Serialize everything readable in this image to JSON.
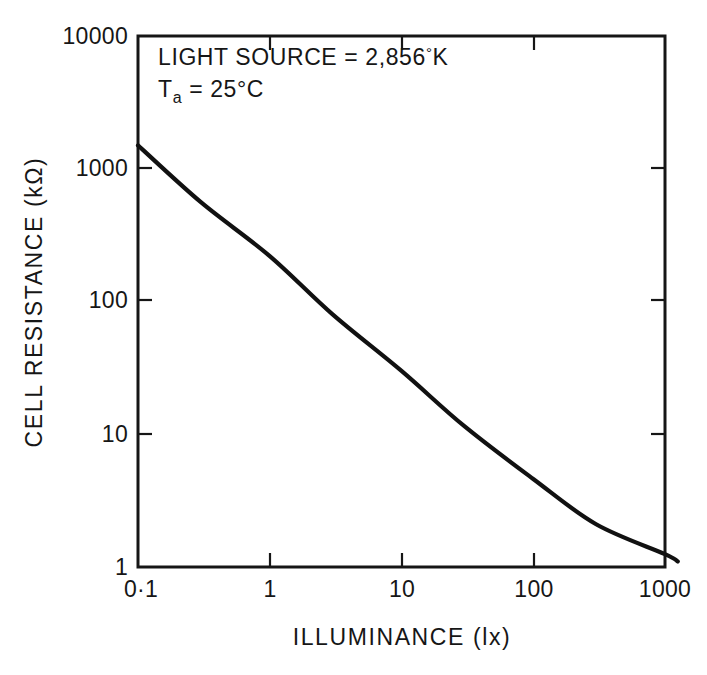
{
  "chart_data": {
    "type": "line",
    "title": "",
    "xlabel": "ILLUMINANCE (lx)",
    "ylabel": "CELL RESISTANCE (kΩ)",
    "xscale": "log",
    "yscale": "log",
    "xlim": [
      0.1,
      1000
    ],
    "ylim": [
      1,
      10000
    ],
    "grid": false,
    "legend": null,
    "xticks": [
      0.1,
      1,
      10,
      100,
      1000
    ],
    "xtick_labels": [
      "0·1",
      "1",
      "10",
      "100",
      "1000"
    ],
    "yticks": [
      1,
      10,
      100,
      1000,
      10000
    ],
    "ytick_labels": [
      "1",
      "10",
      "100",
      "1000",
      "10000"
    ],
    "series": [
      {
        "name": "cell resistance",
        "x": [
          0.1,
          0.3,
          1,
          3,
          10,
          30,
          100,
          300,
          1000,
          1250
        ],
        "y": [
          1500,
          560,
          220,
          80,
          30,
          11.5,
          4.6,
          2.1,
          1.25,
          1.1
        ]
      }
    ],
    "annotations": [
      {
        "id": "light-source",
        "text": "LIGHT SOURCE = 2,856°K",
        "prefix": "LIGHT SOURCE = 2,856",
        "superscript": "°",
        "suffix": "K"
      },
      {
        "id": "ambient-temperature",
        "text": "Ta = 25°C",
        "prefix": "T",
        "subscript": "a",
        "suffix": " = 25°C"
      }
    ]
  },
  "axes": {
    "y_title": "CELL RESISTANCE (kΩ)",
    "x_title": "ILLUMINANCE (lx)",
    "y_labels": [
      "10000",
      "1000",
      "100",
      "10",
      "1"
    ],
    "x_labels": [
      "0·1",
      "1",
      "10",
      "100",
      "1000"
    ]
  },
  "annotation_block": {
    "line1_prefix": "LIGHT SOURCE = 2,856",
    "line1_degree": "°",
    "line1_suffix": "K",
    "line2_prefix": "T",
    "line2_sub": "a",
    "line2_suffix": " = 25°C"
  },
  "colors": {
    "ink": "#161616",
    "curve": "#111111",
    "background": "#ffffff"
  }
}
